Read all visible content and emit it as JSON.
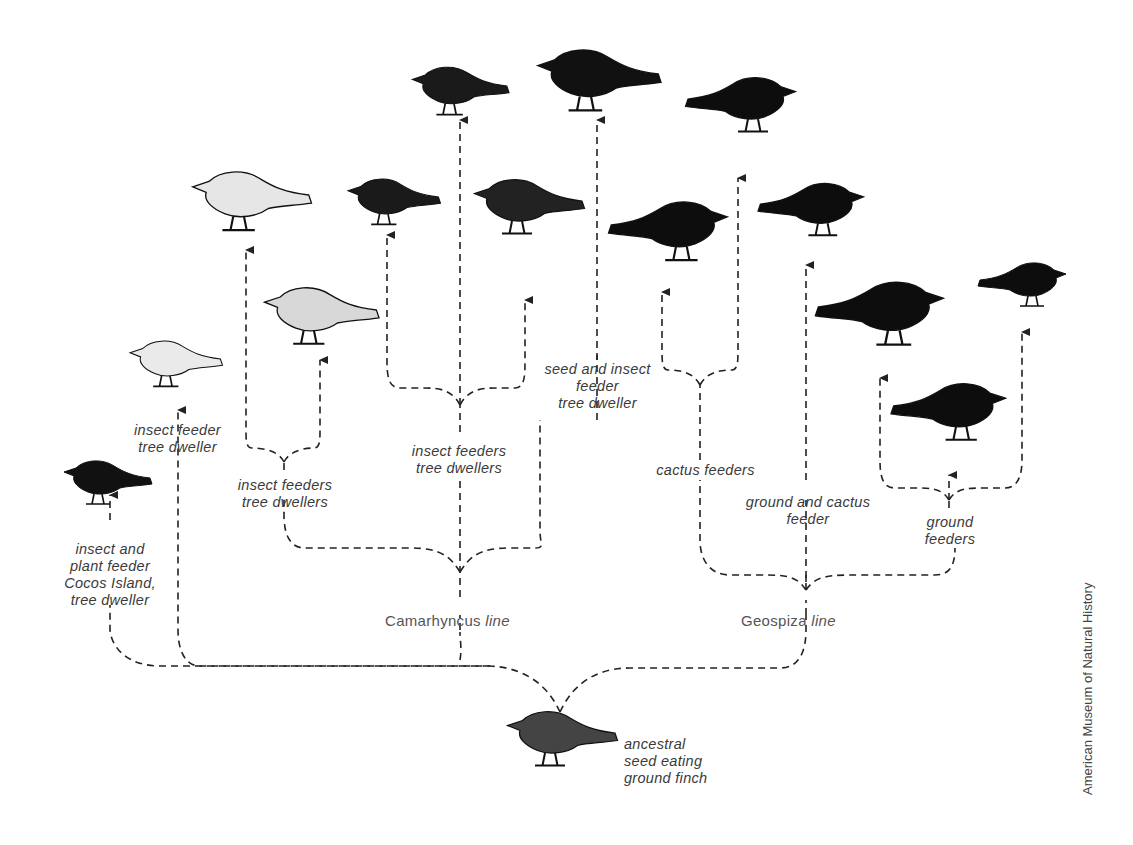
{
  "diagram": {
    "credit": "American Museum of Natural History",
    "root": {
      "label": "ancestral\nseed eating\nground finch"
    },
    "lines": [
      {
        "name": "Camarhyncus",
        "suffix": "line"
      },
      {
        "name": "Geospiza",
        "suffix": "line"
      }
    ],
    "labels": {
      "cocos": "insect and\nplant feeder\nCocos Island,\ntree dweller",
      "insect_feeder_single": "insect feeder\ntree dweller",
      "insect_feeders_left": "insect feeders\ntree dwellers",
      "insect_feeders_center": "insect feeders\ntree dwellers",
      "seed_insect": "seed and insect\nfeeder\ntree dweller",
      "cactus": "cactus feeders",
      "ground_cactus": "ground and cactus\nfeeder",
      "ground": "ground\nfeeders"
    },
    "bird_count": 14,
    "colors": {
      "line": "#222222",
      "text": "#3a3a3a",
      "bird_dark": "#111111",
      "bird_light": "#e8e8e8"
    }
  }
}
